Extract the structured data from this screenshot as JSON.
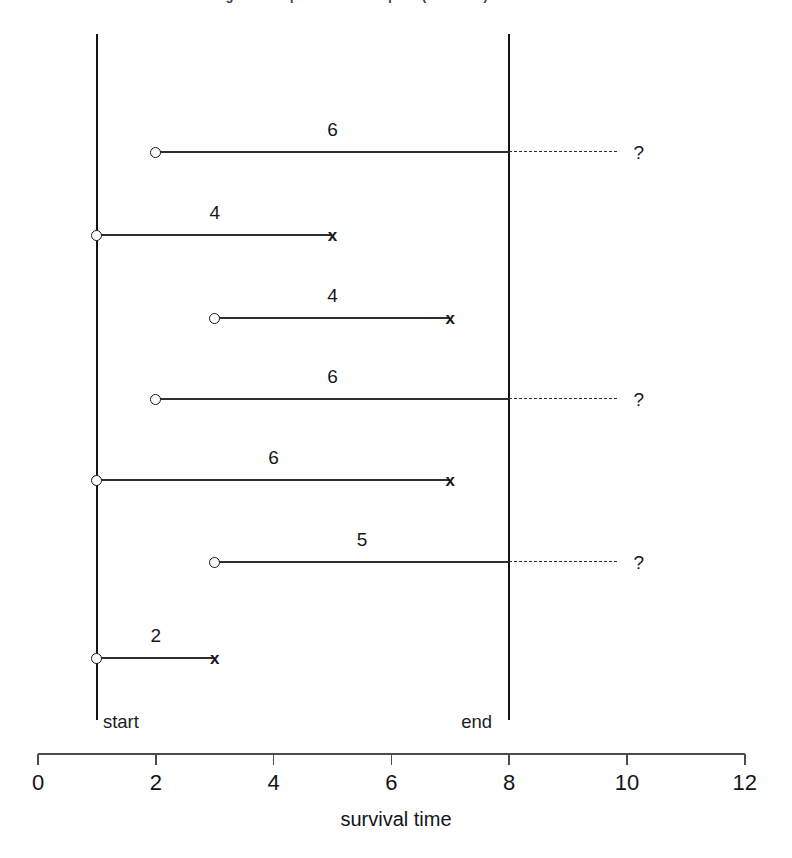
{
  "figure": {
    "title_clipped": "Figure: Complete and incomplete (censored) survival times",
    "axis_title": "survival time",
    "start_label": "start",
    "end_label": "end",
    "censored_symbol": "?",
    "death_symbol": "x",
    "entry_symbol": "o",
    "line_color": "#2b2f33",
    "axis_color": "#4a4d50",
    "background": "#ffffff"
  },
  "chart_data": {
    "type": "line",
    "title": "Complete and incomplete (censored) survival times",
    "xlabel": "survival time",
    "ylabel": "",
    "xlim": [
      0,
      12
    ],
    "xticks": [
      0,
      2,
      4,
      6,
      8,
      10,
      12
    ],
    "xticklabels": [
      "0",
      "2",
      "4",
      "6",
      "8",
      "10",
      "12"
    ],
    "grid": false,
    "legend": "none",
    "study_start": 1,
    "study_end": 8,
    "study_start_label": "start",
    "study_end_label": "end",
    "annotations": [
      "o = entry into study",
      "x = death (complete observation)",
      "? = still alive at study end (censored)"
    ],
    "subjects": [
      {
        "id": 1,
        "entry": 2,
        "observed_end": 8,
        "censored_to": 10.2,
        "duration": 6,
        "duration_label": "6",
        "status": "censored",
        "end_symbol": "?"
      },
      {
        "id": 2,
        "entry": 1,
        "observed_end": 5,
        "censored_to": null,
        "duration": 4,
        "duration_label": "4",
        "status": "death",
        "end_symbol": "x"
      },
      {
        "id": 3,
        "entry": 3,
        "observed_end": 7,
        "censored_to": null,
        "duration": 4,
        "duration_label": "4",
        "status": "death",
        "end_symbol": "x"
      },
      {
        "id": 4,
        "entry": 2,
        "observed_end": 8,
        "censored_to": 10.2,
        "duration": 6,
        "duration_label": "6",
        "status": "censored",
        "end_symbol": "?"
      },
      {
        "id": 5,
        "entry": 1,
        "observed_end": 7,
        "censored_to": null,
        "duration": 6,
        "duration_label": "6",
        "status": "death",
        "end_symbol": "x"
      },
      {
        "id": 6,
        "entry": 3,
        "observed_end": 8,
        "censored_to": 10.2,
        "duration": 5,
        "duration_label": "5",
        "status": "censored",
        "end_symbol": "?"
      },
      {
        "id": 7,
        "entry": 1,
        "observed_end": 3,
        "censored_to": null,
        "duration": 2,
        "duration_label": "2",
        "status": "death",
        "end_symbol": "x"
      }
    ]
  }
}
